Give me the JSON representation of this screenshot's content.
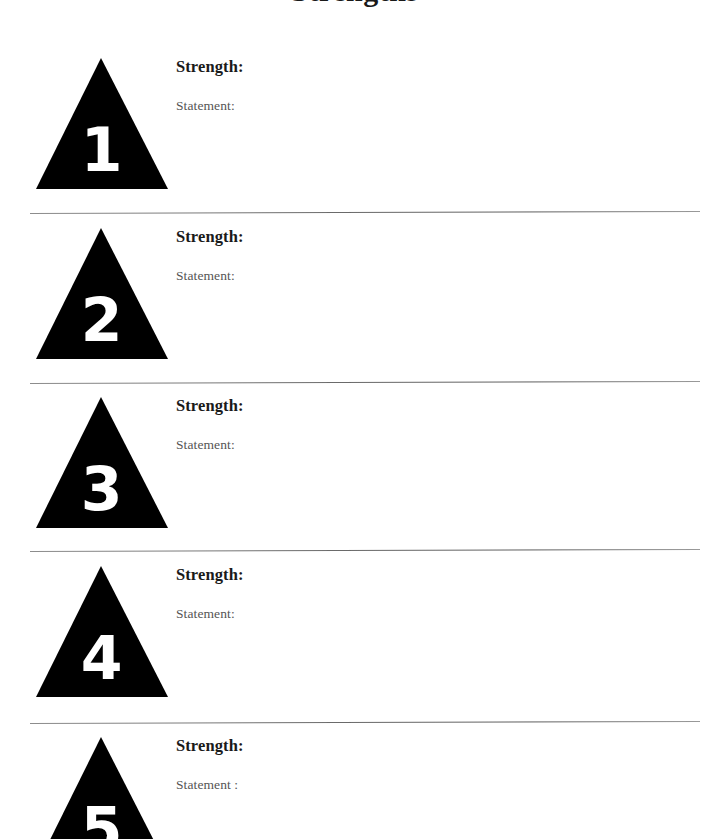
{
  "page": {
    "title_partial": "Strengths",
    "background_color": "#ffffff",
    "triangle_color": "#000000",
    "numeral_color": "#ffffff",
    "strength_label_color": "#1a1a1a",
    "statement_label_color": "#555555",
    "separator_color": "#6f6f6f"
  },
  "sections": [
    {
      "number": "1",
      "strength_label": "Strength:",
      "statement_label": "Statement:",
      "strength_value": "",
      "statement_value": ""
    },
    {
      "number": "2",
      "strength_label": "Strength:",
      "statement_label": "Statement:",
      "strength_value": "",
      "statement_value": ""
    },
    {
      "number": "3",
      "strength_label": "Strength:",
      "statement_label": "Statement:",
      "strength_value": "",
      "statement_value": ""
    },
    {
      "number": "4",
      "strength_label": "Strength:",
      "statement_label": "Statement:",
      "strength_value": "",
      "statement_value": ""
    },
    {
      "number": "5",
      "strength_label": "Strength:",
      "statement_label": "Statement :",
      "strength_value": "",
      "statement_value": ""
    }
  ]
}
